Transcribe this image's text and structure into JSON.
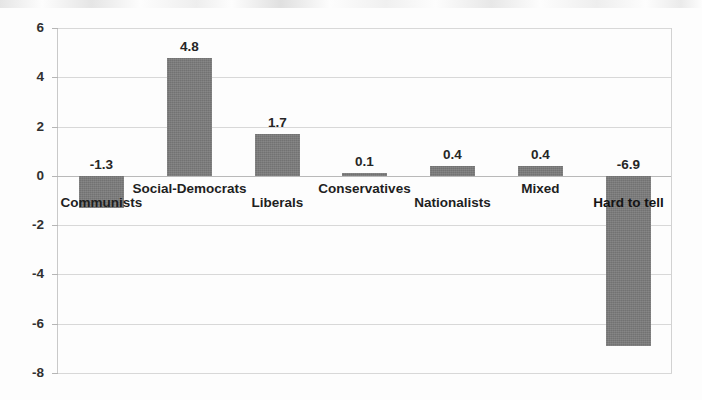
{
  "chart_data": {
    "type": "bar",
    "title": "",
    "subtitle": "",
    "xlabel": "",
    "ylabel": "",
    "ylim": [
      -8,
      6
    ],
    "y_ticks": [
      "6",
      "4",
      "2",
      "0",
      "-2",
      "-4",
      "-6",
      "-8"
    ],
    "y_tick_values": [
      6,
      4,
      2,
      0,
      -2,
      -4,
      -6,
      -8
    ],
    "grid": true,
    "legend": "none",
    "categories": [
      "Communists",
      "Social-Democrats",
      "Liberals",
      "Conservatives",
      "Nationalists",
      "Mixed",
      "Hard to tell"
    ],
    "values": [
      -1.3,
      4.8,
      1.7,
      0.1,
      0.4,
      0.4,
      -6.9
    ],
    "data_labels": [
      "-1.3",
      "4.8",
      "1.7",
      "0.1",
      "0.4",
      "0.4",
      "-6.9"
    ],
    "bar_color": "#7b7b7b",
    "grid_color": "#d8d8d8",
    "axis_color": "#c9c9c9",
    "label_color": "#1f1f1f"
  },
  "axis": {
    "y_labels": [
      {
        "text": "6",
        "value": 6
      },
      {
        "text": "4",
        "value": 4
      },
      {
        "text": "2",
        "value": 2
      },
      {
        "text": "0",
        "value": 0
      },
      {
        "text": "-2",
        "value": -2
      },
      {
        "text": "-4",
        "value": -4
      },
      {
        "text": "-6",
        "value": -6
      },
      {
        "text": "-8",
        "value": -8
      }
    ]
  },
  "bars": [
    {
      "category": "Communists",
      "value": -1.3,
      "label": "-1.3",
      "label_row": "lower"
    },
    {
      "category": "Social-Democrats",
      "value": 4.8,
      "label": "4.8",
      "label_row": "upper"
    },
    {
      "category": "Liberals",
      "value": 1.7,
      "label": "1.7",
      "label_row": "lower"
    },
    {
      "category": "Conservatives",
      "value": 0.1,
      "label": "0.1",
      "label_row": "upper"
    },
    {
      "category": "Nationalists",
      "value": 0.4,
      "label": "0.4",
      "label_row": "lower"
    },
    {
      "category": "Mixed",
      "value": 0.4,
      "label": "0.4",
      "label_row": "upper"
    },
    {
      "category": "Hard to tell",
      "value": -6.9,
      "label": "-6.9",
      "label_row": "lower"
    }
  ]
}
